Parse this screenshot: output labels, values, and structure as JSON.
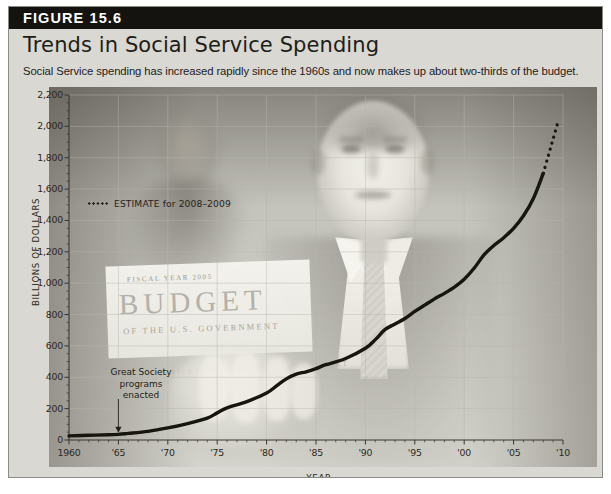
{
  "figure": {
    "number_label": "FIGURE 15.6",
    "title": "Trends in Social Service Spending",
    "subtitle": "Social Service spending has increased rapidly since the 1960s and now makes up about two-thirds of the budget."
  },
  "legend": {
    "estimate_label": "ESTIMATE for 2008–2009"
  },
  "annotation": {
    "text": "Great Society programs enacted",
    "line1": "Great Society",
    "line2": "programs",
    "line3": "enacted",
    "at_year": 1965
  },
  "photo": {
    "book_line1": "FISCAL YEAR 2005",
    "book_line2": "BUDGET",
    "book_line3": "OF THE U.S. GOVERNMENT",
    "book_line4": "OFFICE OF MANAGEMENT AND BUDGET"
  },
  "colors": {
    "card_background": "#d9d8d2",
    "card_border": "#8c8c86",
    "figure_bar": "#14130f",
    "figure_bar_text": "#ffffff",
    "line": "#17150f",
    "grid": "#b6b4ad",
    "axis": "#3a362e",
    "text": "#24211c"
  },
  "chart_data": {
    "type": "line",
    "title": "Trends in Social Service Spending",
    "subtitle": "Social Service spending has increased rapidly since the 1960s and now makes up about two-thirds of the budget.",
    "xlabel": "YEAR",
    "ylabel": "BILLIONS OF DOLLARS",
    "xlim": [
      1960,
      2010
    ],
    "ylim": [
      0,
      2200
    ],
    "ytick_values": [
      0,
      200,
      400,
      600,
      800,
      1000,
      1200,
      1400,
      1600,
      1800,
      2000,
      2200
    ],
    "ytick_labels": [
      "0",
      "200",
      "400",
      "600",
      "800",
      "1,000",
      "1,200",
      "1,400",
      "1,600",
      "1,800",
      "2,000",
      "2,200"
    ],
    "xtick_values": [
      1960,
      1965,
      1970,
      1975,
      1980,
      1985,
      1990,
      1995,
      2000,
      2005,
      2010
    ],
    "xtick_labels": [
      "1960",
      "'65",
      "'70",
      "'75",
      "'80",
      "'85",
      "'90",
      "'95",
      "'00",
      "'05",
      "'10"
    ],
    "minor_tick_interval_years": 1,
    "grid": true,
    "grid_axis": "both",
    "legend_position": "inside-upper-left",
    "series": [
      {
        "name": "Social Service spending (actual)",
        "style": "solid",
        "x": [
          1960,
          1962,
          1964,
          1965,
          1966,
          1968,
          1970,
          1972,
          1974,
          1975,
          1976,
          1978,
          1980,
          1981,
          1982,
          1983,
          1984,
          1985,
          1986,
          1988,
          1990,
          1991,
          1992,
          1993,
          1994,
          1995,
          1996,
          1997,
          1998,
          1999,
          2000,
          2001,
          2002,
          2003,
          2004,
          2005,
          2006,
          2007,
          2008
        ],
        "y": [
          26,
          30,
          33,
          36,
          42,
          55,
          77,
          105,
          140,
          173,
          205,
          245,
          300,
          345,
          390,
          420,
          435,
          455,
          480,
          520,
          585,
          640,
          705,
          740,
          775,
          820,
          860,
          900,
          935,
          975,
          1025,
          1095,
          1180,
          1240,
          1290,
          1350,
          1430,
          1540,
          1700
        ]
      },
      {
        "name": "ESTIMATE for 2008–2009",
        "style": "dotted",
        "x": [
          2008,
          2008.5,
          2009,
          2009.5
        ],
        "y": [
          1700,
          1810,
          1920,
          2030
        ]
      }
    ],
    "annotations": [
      {
        "text": "Great Society programs enacted",
        "x": 1965,
        "y": 36,
        "arrow": true
      }
    ]
  }
}
